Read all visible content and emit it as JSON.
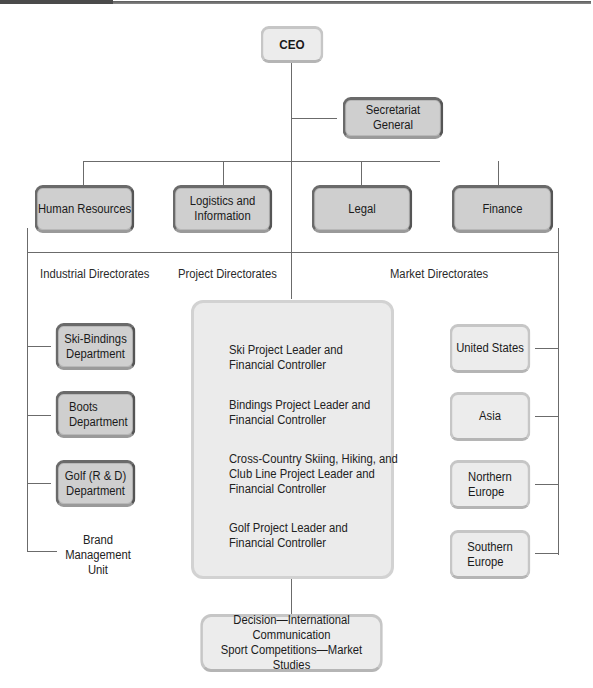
{
  "chart_title": "",
  "nodes": {
    "ceo": "CEO",
    "secretariat": "Secretariat General",
    "staff": [
      {
        "id": "human-resources",
        "lines": [
          "Human Resources"
        ]
      },
      {
        "id": "logistics",
        "lines": [
          "Logistics and",
          "Information"
        ]
      },
      {
        "id": "legal",
        "lines": [
          "Legal"
        ]
      },
      {
        "id": "finance",
        "lines": [
          "Finance"
        ]
      }
    ],
    "group_labels": {
      "industrial": "Industrial Directorates",
      "project": "Project Directorates",
      "market": "Market Directorates"
    },
    "industrial": [
      {
        "id": "ski-bindings",
        "lines": [
          "Ski-Bindings",
          "Department"
        ]
      },
      {
        "id": "boots",
        "lines": [
          "Boots",
          "Department"
        ]
      },
      {
        "id": "golf-rd",
        "lines": [
          "Golf (R & D)",
          "Department"
        ]
      }
    ],
    "brand_unit": [
      "Brand",
      "Management",
      "Unit"
    ],
    "project": [
      {
        "id": "ski-project",
        "lines": [
          "Ski Project Leader and",
          "Financial Controller"
        ]
      },
      {
        "id": "bindings-project",
        "lines": [
          "Bindings Project Leader and",
          "Financial Controller"
        ]
      },
      {
        "id": "cross-country-project",
        "lines": [
          "Cross-Country Skiing, Hiking, and",
          "Club Line Project Leader and",
          "Financial Controller"
        ]
      },
      {
        "id": "golf-project",
        "lines": [
          "Golf Project Leader and",
          "Financial Controller"
        ]
      }
    ],
    "decision": [
      "Decision—International Communication",
      "Sport Competitions—Market Studies"
    ],
    "market": [
      {
        "id": "united-states",
        "lines": [
          "United States"
        ]
      },
      {
        "id": "asia",
        "lines": [
          "Asia"
        ]
      },
      {
        "id": "northern-europe",
        "lines": [
          "Northern",
          "Europe"
        ]
      },
      {
        "id": "southern-europe",
        "lines": [
          "Southern",
          "Europe"
        ]
      }
    ]
  }
}
